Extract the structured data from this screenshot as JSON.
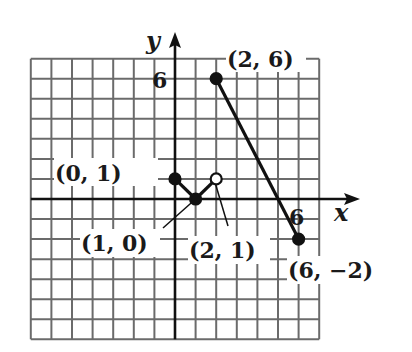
{
  "chart_data": {
    "type": "line",
    "title": "",
    "xlabel": "x",
    "ylabel": "y",
    "xlim": [
      -7,
      7
    ],
    "ylim": [
      -7,
      7
    ],
    "grid": true,
    "x_tick_labels": [
      {
        "value": 6,
        "label": "6"
      }
    ],
    "y_tick_labels": [
      {
        "value": 6,
        "label": "6"
      }
    ],
    "segments": [
      {
        "from": [
          0,
          1
        ],
        "to": [
          1,
          0
        ],
        "from_closed": true,
        "to_closed": true
      },
      {
        "from": [
          1,
          0
        ],
        "to": [
          2,
          1
        ],
        "from_closed": true,
        "to_closed": false
      },
      {
        "from": [
          2,
          6
        ],
        "to": [
          6,
          -2
        ],
        "from_closed": true,
        "to_closed": true
      }
    ],
    "points": [
      {
        "x": 0,
        "y": 1,
        "closed": true,
        "label": "(0, 1)"
      },
      {
        "x": 1,
        "y": 0,
        "closed": true,
        "label": "(1, 0)"
      },
      {
        "x": 2,
        "y": 1,
        "closed": false,
        "label": "(2, 1)"
      },
      {
        "x": 2,
        "y": 6,
        "closed": true,
        "label": "(2, 6)"
      },
      {
        "x": 6,
        "y": -2,
        "closed": true,
        "label": "(6, -2)"
      }
    ]
  },
  "labels": {
    "x_axis": "x",
    "y_axis": "y",
    "x_tick_6": "6",
    "y_tick_6": "6",
    "p01": "(0, 1)",
    "p10": "(1, 0)",
    "p21": "(2, 1)",
    "p26": "(2, 6)",
    "p6m2": "(6, −2)"
  }
}
